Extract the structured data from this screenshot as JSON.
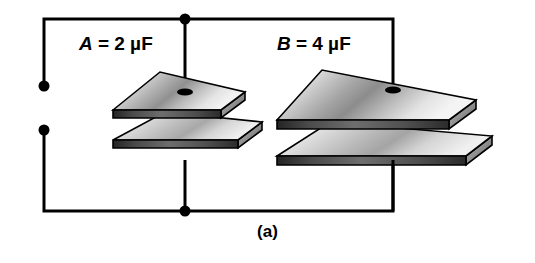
{
  "figure": {
    "caption": "(a)",
    "background_color": "#ffffff",
    "line_color": "#000000",
    "type": "circuit-diagram"
  },
  "labels": {
    "capacitor_a": {
      "symbol": "A",
      "equals": "=",
      "value": "2",
      "unit": "µF",
      "full": "A = 2 µF"
    },
    "capacitor_b": {
      "symbol": "B",
      "equals": "=",
      "value": "4",
      "unit": "µF",
      "full": "B = 4 µF"
    }
  },
  "components": {
    "capacitor_a": {
      "name": "capacitor-a",
      "plates": 2,
      "plate_fill_light": "#e8e8e8",
      "plate_fill_mid": "#c2c2c2",
      "plate_fill_dark": "#8f8f8f",
      "edge_fill": "#3a3a3a"
    },
    "capacitor_b": {
      "name": "capacitor-b",
      "plates": 2,
      "plate_fill_light": "#e8e8e8",
      "plate_fill_mid": "#c2c2c2",
      "plate_fill_dark": "#8f8f8f",
      "edge_fill": "#3a3a3a"
    }
  },
  "terminals": {
    "top_terminal": {
      "name": "top-terminal-dot"
    },
    "bottom_terminal": {
      "name": "bottom-terminal-dot"
    },
    "top_junction": {
      "name": "top-junction-dot"
    },
    "bottom_junction": {
      "name": "bottom-junction-dot"
    }
  }
}
